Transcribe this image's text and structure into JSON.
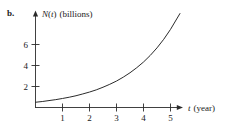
{
  "figure": {
    "part_label": "b.",
    "background_color": "#ffffff",
    "ink_color": "#2b2b2b"
  },
  "chart_data": {
    "type": "line",
    "title": "",
    "subtitle": "",
    "xlabel": "t (year)",
    "ylabel": "N(t) (billions)",
    "ylabel_parts": {
      "variable": "N",
      "open_paren": "(",
      "argument": "t",
      "close_paren": ")",
      "units": "(billions)"
    },
    "xlabel_parts": {
      "variable": "t",
      "units": "(year)"
    },
    "xlim": [
      0,
      5.5
    ],
    "ylim": [
      0,
      8.6
    ],
    "xticks": [
      1,
      2,
      3,
      4,
      5
    ],
    "xtick_labels": [
      "1",
      "2",
      "3",
      "4",
      "5"
    ],
    "yticks": [
      2,
      4,
      6
    ],
    "ytick_labels": [
      "2",
      "4",
      "6"
    ],
    "grid": false,
    "legend": false,
    "legend_position": "none",
    "axis_arrows": true,
    "series": [
      {
        "name": "N(t)",
        "description": "exponential growth curve",
        "x": [
          0,
          0.25,
          0.5,
          0.75,
          1,
          1.25,
          1.5,
          1.75,
          2,
          2.25,
          2.5,
          2.75,
          3,
          3.25,
          3.5,
          3.75,
          4,
          4.25,
          4.5,
          4.75,
          5,
          5.25,
          5.35
        ],
        "y": [
          0.5,
          0.57,
          0.66,
          0.75,
          0.86,
          0.98,
          1.12,
          1.29,
          1.47,
          1.68,
          1.93,
          2.21,
          2.52,
          2.89,
          3.31,
          3.79,
          4.33,
          4.96,
          5.68,
          6.5,
          7.44,
          8.52,
          8.95
        ]
      }
    ],
    "annotations": []
  }
}
